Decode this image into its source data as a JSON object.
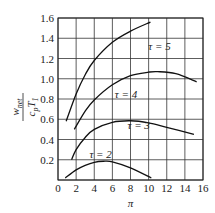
{
  "chart_data": {
    "type": "line",
    "title": "",
    "xlabel": "π",
    "ylabel": "w_net / c_p T_1",
    "xlim": [
      0,
      16
    ],
    "ylim": [
      0,
      1.6
    ],
    "grid": true,
    "xticks": [
      "0",
      "2",
      "4",
      "6",
      "8",
      "10",
      "12",
      "14",
      "16"
    ],
    "yticks": [
      "0.2",
      "0.4",
      "0.6",
      "0.8",
      "1.0",
      "1.2",
      "1.4",
      "1.6"
    ],
    "series": [
      {
        "name": "τ = 5",
        "label_pos": [
          11.2,
          1.28
        ],
        "x": [
          0.9,
          2,
          3,
          4,
          6,
          8,
          10.2
        ],
        "y": [
          0.58,
          0.85,
          1.04,
          1.18,
          1.36,
          1.47,
          1.56
        ]
      },
      {
        "name": "τ = 4",
        "label_pos": [
          7.5,
          0.81
        ],
        "x": [
          1.8,
          3,
          4,
          6,
          8,
          10,
          11,
          13,
          15.3
        ],
        "y": [
          0.5,
          0.68,
          0.79,
          0.94,
          1.03,
          1.065,
          1.07,
          1.05,
          0.97
        ]
      },
      {
        "name": "τ = 3",
        "label_pos": [
          8.9,
          0.5
        ],
        "x": [
          1.5,
          2,
          3,
          4,
          6,
          8,
          10,
          12,
          15
        ],
        "y": [
          0.2,
          0.3,
          0.42,
          0.5,
          0.57,
          0.585,
          0.565,
          0.52,
          0.45
        ]
      },
      {
        "name": "τ = 2",
        "label_pos": [
          4.7,
          0.22
        ],
        "x": [
          0.8,
          2,
          3,
          4,
          5,
          6,
          8,
          10.3
        ],
        "y": [
          0.02,
          0.1,
          0.145,
          0.175,
          0.185,
          0.18,
          0.12,
          0.02
        ]
      }
    ]
  }
}
